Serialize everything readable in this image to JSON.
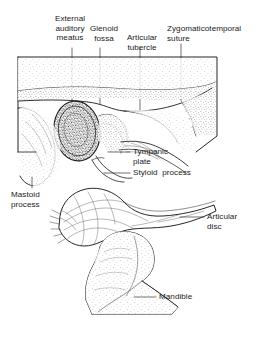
{
  "figure": {
    "type": "anatomical-line-diagram",
    "background_color": "#ffffff",
    "ink_color": "#1a1a1a"
  },
  "labels": {
    "external_auditory_meatus": "External\nauditory\nmeatus",
    "glenoid_fossa": "Glenoid\nfossa",
    "articular_tubercle": "Articular\ntubercle",
    "zygomaticotemporal_suture": "Zygomaticotemporal\nsuture",
    "tympanic_plate": "Tympanic\nplate",
    "styloid_process": "Styloid  process",
    "mastoid_process": "Mastoid\nprocess",
    "articular_disc": "Articular\ndisc",
    "mandible": "Mandible"
  },
  "structures": [
    {
      "name": "external-auditory-meatus",
      "label": "External auditory meatus",
      "callout": "top",
      "leader_x": 72
    },
    {
      "name": "glenoid-fossa",
      "label": "Glenoid fossa",
      "callout": "top",
      "leader_x": 100
    },
    {
      "name": "articular-tubercle",
      "label": "Articular tubercle",
      "callout": "top",
      "leader_x": 140
    },
    {
      "name": "zygomaticotemporal-suture",
      "label": "Zygomaticotemporal suture",
      "callout": "top",
      "leader_x": 181
    },
    {
      "name": "tympanic-plate",
      "label": "Tympanic plate",
      "callout": "right"
    },
    {
      "name": "styloid-process",
      "label": "Styloid process",
      "callout": "right"
    },
    {
      "name": "mastoid-process",
      "label": "Mastoid process",
      "callout": "left"
    },
    {
      "name": "articular-disc",
      "label": "Articular disc",
      "callout": "right"
    },
    {
      "name": "mandible",
      "label": "Mandible",
      "callout": "right"
    }
  ]
}
